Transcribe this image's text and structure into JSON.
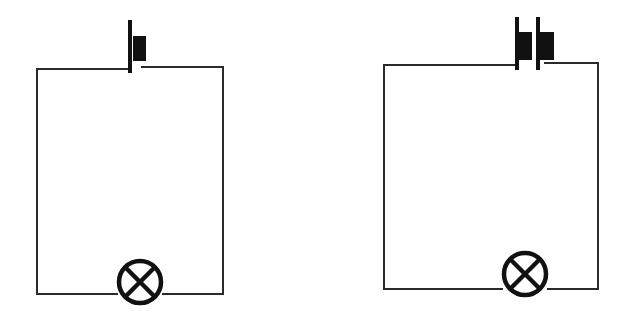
{
  "diagram": {
    "circuits": [
      {
        "id": "circuit-one-cell",
        "cells": 1,
        "components": [
          "cell",
          "lamp"
        ]
      },
      {
        "id": "circuit-two-cells",
        "cells": 2,
        "components": [
          "cell",
          "cell",
          "lamp"
        ]
      }
    ],
    "colors": {
      "wire": "#2a2a2a",
      "symbol": "#111111",
      "background": "#ffffff"
    }
  }
}
